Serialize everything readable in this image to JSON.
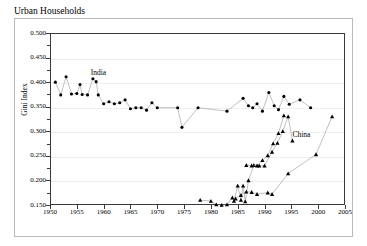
{
  "chart_data": {
    "type": "line",
    "title": "Urban Households",
    "xlabel": "",
    "ylabel": "Gini Index",
    "xlim": [
      1950,
      2005
    ],
    "ylim": [
      0.15,
      0.5
    ],
    "xticks": [
      1950,
      1955,
      1960,
      1965,
      1970,
      1975,
      1980,
      1985,
      1990,
      1995,
      2000,
      2005
    ],
    "xtick_labels": [
      "1950",
      "1955",
      "1960",
      "1965",
      "1970",
      "1975",
      "1980",
      "1985",
      "1990",
      "1995",
      "2000",
      "2005"
    ],
    "yticks": [
      0.15,
      0.2,
      0.25,
      0.3,
      0.35,
      0.4,
      0.45,
      0.5
    ],
    "ytick_labels": [
      "0.150",
      "0.200",
      "0.250",
      "0.300",
      "0.350",
      "0.400",
      "0.450",
      "0.500"
    ],
    "grid": "horizontal",
    "legend": "none",
    "annotations": [
      {
        "text": "India",
        "x": 1957.6,
        "y": 0.418,
        "series": "india"
      },
      {
        "text": "China",
        "x": 1995.2,
        "y": 0.292,
        "series": "china"
      }
    ],
    "series": [
      {
        "name": "India",
        "marker": "filled-circle",
        "color": "#000000",
        "line_color": "#808080",
        "points": [
          {
            "x": 1951,
            "y": 0.4
          },
          {
            "x": 1952,
            "y": 0.374
          },
          {
            "x": 1953,
            "y": 0.411
          },
          {
            "x": 1954,
            "y": 0.376
          },
          {
            "x": 1955,
            "y": 0.377
          },
          {
            "x": 1955.6,
            "y": 0.395
          },
          {
            "x": 1956,
            "y": 0.375
          },
          {
            "x": 1957,
            "y": 0.374
          },
          {
            "x": 1958,
            "y": 0.407
          },
          {
            "x": 1958.6,
            "y": 0.401
          },
          {
            "x": 1959,
            "y": 0.374
          },
          {
            "x": 1960,
            "y": 0.356
          },
          {
            "x": 1961,
            "y": 0.36
          },
          {
            "x": 1962,
            "y": 0.356
          },
          {
            "x": 1963,
            "y": 0.358
          },
          {
            "x": 1964,
            "y": 0.364
          },
          {
            "x": 1965,
            "y": 0.346
          },
          {
            "x": 1966,
            "y": 0.348
          },
          {
            "x": 1967,
            "y": 0.348
          },
          {
            "x": 1968,
            "y": 0.343
          },
          {
            "x": 1969,
            "y": 0.358
          },
          {
            "x": 1970,
            "y": 0.348
          },
          {
            "x": 1973.8,
            "y": 0.348
          },
          {
            "x": 1974.6,
            "y": 0.308
          },
          {
            "x": 1977.6,
            "y": 0.348
          },
          {
            "x": 1983,
            "y": 0.341
          },
          {
            "x": 1986,
            "y": 0.367
          },
          {
            "x": 1987,
            "y": 0.352
          },
          {
            "x": 1987.8,
            "y": 0.348
          },
          {
            "x": 1988.6,
            "y": 0.356
          },
          {
            "x": 1989.6,
            "y": 0.341
          },
          {
            "x": 1990.8,
            "y": 0.379
          },
          {
            "x": 1991.8,
            "y": 0.352
          },
          {
            "x": 1992.6,
            "y": 0.344
          },
          {
            "x": 1993.6,
            "y": 0.371
          },
          {
            "x": 1994.6,
            "y": 0.355
          },
          {
            "x": 1996.6,
            "y": 0.364
          },
          {
            "x": 1998.6,
            "y": 0.348
          }
        ]
      },
      {
        "name": "China urban series A",
        "marker": "filled-triangle",
        "color": "#000000",
        "line_color": "#808080",
        "points": [
          {
            "x": 1978,
            "y": 0.16
          },
          {
            "x": 1980,
            "y": 0.158
          },
          {
            "x": 1981,
            "y": 0.151
          },
          {
            "x": 1982,
            "y": 0.15
          },
          {
            "x": 1983,
            "y": 0.151
          },
          {
            "x": 1984,
            "y": 0.165
          },
          {
            "x": 1984.3,
            "y": 0.158
          },
          {
            "x": 1985,
            "y": 0.189
          },
          {
            "x": 1985.6,
            "y": 0.16
          },
          {
            "x": 1986,
            "y": 0.189
          },
          {
            "x": 1986.4,
            "y": 0.157
          },
          {
            "x": 1987,
            "y": 0.2
          },
          {
            "x": 1988,
            "y": 0.231
          },
          {
            "x": 1989,
            "y": 0.23
          },
          {
            "x": 1990,
            "y": 0.23
          },
          {
            "x": 1991.4,
            "y": 0.258
          },
          {
            "x": 1992.4,
            "y": 0.276
          },
          {
            "x": 1993.4,
            "y": 0.3
          },
          {
            "x": 1994.4,
            "y": 0.33
          },
          {
            "x": 1995.2,
            "y": 0.281
          }
        ]
      },
      {
        "name": "China urban series B",
        "marker": "filled-triangle",
        "color": "#000000",
        "line_color": "#808080",
        "points": [
          {
            "x": 1984.6,
            "y": 0.163
          },
          {
            "x": 1985.6,
            "y": 0.17
          },
          {
            "x": 1986.6,
            "y": 0.177
          },
          {
            "x": 1987.6,
            "y": 0.176
          },
          {
            "x": 1988.6,
            "y": 0.172
          },
          {
            "x": 1990.6,
            "y": 0.175
          },
          {
            "x": 1991.4,
            "y": 0.172
          },
          {
            "x": 1994.4,
            "y": 0.214
          },
          {
            "x": 1999.6,
            "y": 0.253
          },
          {
            "x": 2002.6,
            "y": 0.33
          }
        ]
      },
      {
        "name": "China urban series C",
        "marker": "filled-triangle",
        "color": "#000000",
        "line_color": "#808080",
        "points": [
          {
            "x": 1986.6,
            "y": 0.231
          },
          {
            "x": 1987.6,
            "y": 0.23
          },
          {
            "x": 1988.6,
            "y": 0.23
          },
          {
            "x": 1989.6,
            "y": 0.241
          },
          {
            "x": 1990.6,
            "y": 0.251
          },
          {
            "x": 1991.6,
            "y": 0.275
          },
          {
            "x": 1992.6,
            "y": 0.296
          },
          {
            "x": 1993.6,
            "y": 0.332
          }
        ]
      }
    ]
  }
}
